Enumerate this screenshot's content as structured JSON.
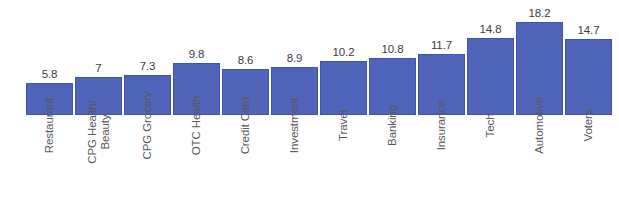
{
  "chart_data": {
    "type": "bar",
    "title": "",
    "subtitle": "",
    "xlabel": "",
    "ylabel": "",
    "grid": false,
    "legend": "none",
    "ylim": [
      0,
      18.2
    ],
    "axis_visible": false,
    "orientation": "vertical",
    "bar_color": "#5064BA",
    "bar_border_color": "#3F53A8",
    "value_label_color": "#3B3B3D",
    "category_label_color": "#58585A",
    "category_label_rotation": -90,
    "background": "#FFFFFF",
    "categories": [
      "Restaurant",
      "CPG Health/\nBeauty",
      "CPG Grocery",
      "OTC Health",
      "Credit Card",
      "Investment",
      "Travel",
      "Banking",
      "Insurance",
      "Tech",
      "Automotive",
      "Voters"
    ],
    "values": [
      5.8,
      7,
      7.3,
      9.8,
      8.6,
      8.9,
      10.2,
      10.8,
      11.7,
      14.8,
      18.2,
      14.7
    ],
    "value_labels": [
      "5.8",
      "7",
      "7.3",
      "9.8",
      "8.6",
      "8.9",
      "10.2",
      "10.8",
      "11.7",
      "14.8",
      "18.2",
      "14.7"
    ]
  }
}
